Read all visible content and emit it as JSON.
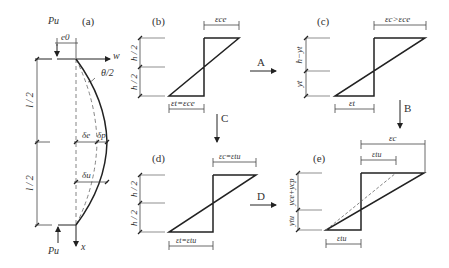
{
  "panels": {
    "a": {
      "label": "(a)",
      "load_top": "Pu",
      "eccentricity": "e0",
      "axis_w": "w",
      "rotation": "θ/2",
      "half_length_top": "l / 2",
      "half_length_bottom": "l / 2",
      "delta_e": "δe",
      "delta_p": "δp",
      "delta_u": "δu",
      "load_bottom": "Pu",
      "axis_x": "x"
    },
    "b": {
      "label": "(b)",
      "top_strain": "εce",
      "bottom_strain": "εt=εce",
      "dim_top": "h / 2",
      "dim_bottom": "h / 2"
    },
    "c": {
      "label": "(c)",
      "top_strain": "εc>εce",
      "bottom_strain": "εt",
      "dim_top": "h−yt",
      "dim_bottom": "yt"
    },
    "d": {
      "label": "(d)",
      "top_strain": "εc=εtu",
      "bottom_strain": "εt=εtu",
      "dim_top": "h / 2",
      "dim_bottom": "h / 2"
    },
    "e": {
      "label": "(e)",
      "top_strain_outer": "εc",
      "top_strain_inner": "εtu",
      "bottom_strain": "εtu",
      "dim_top": "yce+ycp",
      "dim_bottom": "ytu"
    }
  },
  "transitions": {
    "A": "A",
    "B": "B",
    "C": "C",
    "D": "D"
  },
  "colors": {
    "line": "#222222",
    "dim": "#444444",
    "dash": "#666666"
  }
}
